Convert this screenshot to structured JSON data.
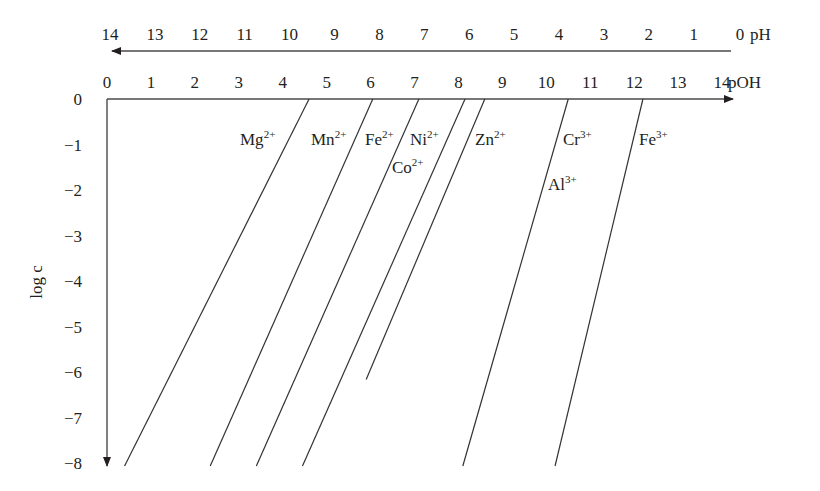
{
  "chart_data": {
    "type": "line",
    "title": "",
    "xlabel": "pOH",
    "x2label": "pH",
    "ylabel": "log c",
    "xlim": [
      0,
      14
    ],
    "ylim": [
      -8,
      0
    ],
    "x_ticks": [
      "0",
      "1",
      "2",
      "3",
      "4",
      "5",
      "6",
      "7",
      "8",
      "9",
      "10",
      "11",
      "12",
      "13",
      "14"
    ],
    "x2_ticks": [
      "14",
      "13",
      "12",
      "11",
      "10",
      "9",
      "8",
      "7",
      "6",
      "5",
      "4",
      "3",
      "2",
      "1",
      "0"
    ],
    "y_ticks": [
      "0",
      "−1",
      "−2",
      "−3",
      "−4",
      "−5",
      "−6",
      "−7",
      "−8"
    ],
    "grid": false,
    "legend": "inline labels",
    "series": [
      {
        "name": "Mg2+",
        "label": "Mg",
        "charge": "2+",
        "points": [
          [
            4.6,
            0
          ],
          [
            0.4,
            -8
          ]
        ]
      },
      {
        "name": "Mn2+",
        "label": "Mn",
        "charge": "2+",
        "points": [
          [
            6.05,
            0
          ],
          [
            2.35,
            -8
          ]
        ]
      },
      {
        "name": "Fe2+",
        "label": "Fe",
        "charge": "2+",
        "points": [
          [
            7.1,
            0
          ],
          [
            3.4,
            -8
          ]
        ]
      },
      {
        "name": "Ni2+ / Co2+",
        "label": "Ni",
        "charge": "2+",
        "label2": "Co",
        "charge2": "2+",
        "points": [
          [
            8.15,
            0
          ],
          [
            4.45,
            -8
          ]
        ]
      },
      {
        "name": "Zn2+",
        "label": "Zn",
        "charge": "2+",
        "points": [
          [
            8.6,
            0
          ],
          [
            5.9,
            -6.1
          ]
        ]
      },
      {
        "name": "Cr3+ / Al3+",
        "label": "Cr",
        "charge": "3+",
        "label2": "Al",
        "charge2": "3+",
        "points": [
          [
            10.5,
            0
          ],
          [
            8.1,
            -8
          ]
        ]
      },
      {
        "name": "Fe3+",
        "label": "Fe",
        "charge": "3+",
        "points": [
          [
            12.2,
            0
          ],
          [
            10.2,
            -8
          ]
        ]
      }
    ]
  },
  "labels": {
    "ph": "pH",
    "poh": "pOH",
    "logc": "log c",
    "mg": "Mg",
    "mg_c": "2+",
    "mn": "Mn",
    "mn_c": "2+",
    "fe2": "Fe",
    "fe2_c": "2+",
    "ni": "Ni",
    "ni_c": "2+",
    "co": "Co",
    "co_c": "2+",
    "zn": "Zn",
    "zn_c": "2+",
    "cr": "Cr",
    "cr_c": "3+",
    "al": "Al",
    "al_c": "3+",
    "fe3": "Fe",
    "fe3_c": "3+"
  }
}
